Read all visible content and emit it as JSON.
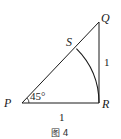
{
  "figure": {
    "caption": "图 4",
    "colors": {
      "stroke": "#1a1a1a",
      "background": "#ffffff"
    },
    "points": {
      "P": {
        "label": "P",
        "x": 22,
        "y": 103
      },
      "Q": {
        "label": "Q",
        "x": 99,
        "y": 22
      },
      "R": {
        "label": "R",
        "x": 99,
        "y": 103
      },
      "S": {
        "label": "S",
        "x": 76,
        "y": 48
      }
    },
    "angle_label": "45°",
    "side_labels": {
      "QR": "1",
      "PR": "1"
    },
    "segments": [
      "PQ",
      "QR",
      "PR"
    ],
    "arc": {
      "center": "P",
      "from": "S",
      "to": "R",
      "radius": "PR"
    }
  }
}
